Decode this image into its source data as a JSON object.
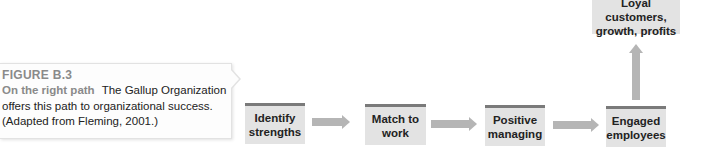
{
  "figure": {
    "label": "FIGURE B.3",
    "title": "On the right path",
    "caption": "The Gallup Organization offers this path to organizational success. (Adapted from Fleming, 2001.)"
  },
  "flow": {
    "steps": [
      {
        "label": "Identify strengths"
      },
      {
        "label": "Match to work"
      },
      {
        "label": "Positive managing"
      },
      {
        "label": "Engaged employees"
      },
      {
        "label": "Loyal customers, growth, profits"
      }
    ],
    "colors": {
      "box_fill": "#e3e3e3",
      "box_top_border": "#7a7a7a",
      "arrow": "#b5b5b5",
      "figure_label": "#8a8a8a"
    }
  }
}
